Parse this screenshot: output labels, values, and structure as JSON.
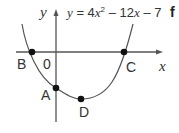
{
  "diagram": {
    "equation": {
      "lhs": "y",
      "eq": " = 4",
      "x1": "x",
      "sup": "2",
      "mid": " – 12",
      "x2": "x",
      "tail": " – 7"
    },
    "part_label": "f",
    "axes": {
      "x_label": "x",
      "y_label": "y",
      "origin_label": "0"
    },
    "points": [
      {
        "label": "A",
        "description": "y-intercept"
      },
      {
        "label": "B",
        "description": "left x-intercept"
      },
      {
        "label": "C",
        "description": "right x-intercept"
      },
      {
        "label": "D",
        "description": "minimum point (vertex)"
      }
    ],
    "colors": {
      "ink": "#333333",
      "dot": "#111111"
    }
  }
}
